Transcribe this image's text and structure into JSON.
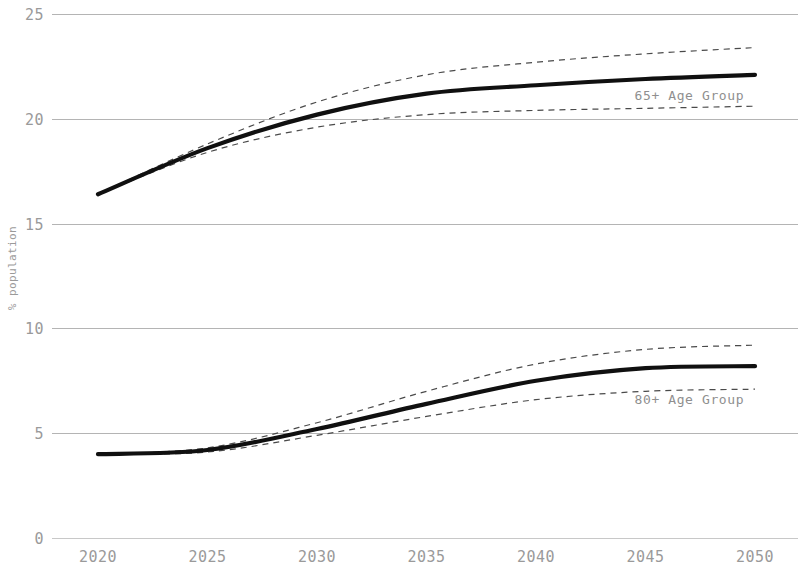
{
  "chart_data": {
    "type": "line",
    "title": "",
    "xlabel": "",
    "ylabel": "% population",
    "xlim": [
      2020,
      2050
    ],
    "ylim": [
      0,
      25
    ],
    "grid": true,
    "legend": "annotations-inline",
    "x": [
      2020,
      2025,
      2030,
      2035,
      2040,
      2045,
      2050
    ],
    "y_ticks": [
      "0",
      "5",
      "10",
      "15",
      "20",
      "25"
    ],
    "y_tick_values": [
      0,
      5,
      10,
      15,
      20,
      25
    ],
    "x_ticks": [
      "2020",
      "2025",
      "2030",
      "2035",
      "2040",
      "2045",
      "2050"
    ],
    "series": [
      {
        "name": "65+ Age Group",
        "style": "solid",
        "color": "#101010",
        "annotation": "65+ Age Group",
        "annotation_x": 2044.5,
        "annotation_y": 20.9,
        "values": [
          16.4,
          18.6,
          20.2,
          21.2,
          21.6,
          21.9,
          22.1
        ],
        "ci_upper": [
          16.4,
          18.8,
          20.8,
          22.1,
          22.7,
          23.1,
          23.4
        ],
        "ci_lower": [
          16.4,
          18.4,
          19.6,
          20.2,
          20.4,
          20.5,
          20.6
        ]
      },
      {
        "name": "80+ Age Group",
        "style": "solid",
        "color": "#101010",
        "annotation": "80+ Age Group",
        "annotation_x": 2044.5,
        "annotation_y": 6.4,
        "values": [
          4.0,
          4.2,
          5.2,
          6.4,
          7.5,
          8.1,
          8.2
        ],
        "ci_upper": [
          4.0,
          4.3,
          5.5,
          7.0,
          8.3,
          9.0,
          9.2
        ],
        "ci_lower": [
          4.0,
          4.1,
          4.9,
          5.8,
          6.6,
          7.0,
          7.1
        ]
      }
    ]
  },
  "axes": {
    "y_title": "% population"
  },
  "annotations": {
    "upper": "65+ Age Group",
    "lower": "80+ Age Group"
  },
  "colors": {
    "line": "#101010",
    "ci": "#4a4a4a",
    "grid": "#b4b4b4",
    "text": "#9a9a9a",
    "background": "#ffffff"
  }
}
